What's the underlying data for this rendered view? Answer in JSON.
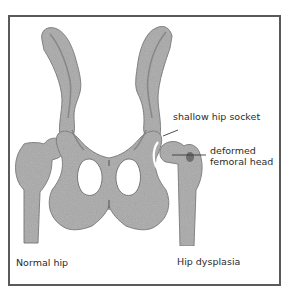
{
  "figure": {
    "colors": {
      "frame": "#5a5a5a",
      "bone_fill": "#a9a9a9",
      "bone_shade": "#8c8c8c",
      "bone_outline": "#6e6e6e",
      "text": "#2b2b2b",
      "leader_line": "#3a3a3a"
    }
  },
  "labels": {
    "shallow_socket": "shallow hip socket",
    "deformed_head_line1": "deformed",
    "deformed_head_line2": "femoral head",
    "normal_hip": "Normal hip",
    "hip_dysplasia": "Hip dysplasia"
  }
}
